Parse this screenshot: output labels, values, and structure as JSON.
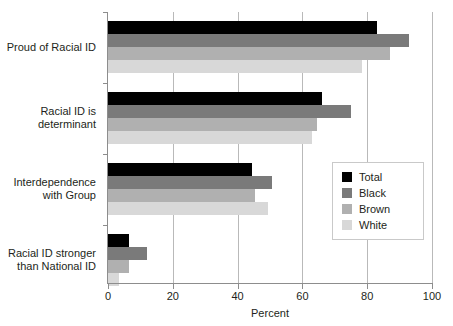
{
  "chart_data": {
    "type": "bar",
    "orientation": "horizontal",
    "title": "",
    "xlabel": "Percent",
    "ylabel": "",
    "xlim": [
      0,
      100
    ],
    "xticks": [
      0,
      20,
      40,
      60,
      80,
      100
    ],
    "xtick_labels": [
      "0",
      "20",
      "40",
      "60",
      "80",
      "100"
    ],
    "grid": "vertical",
    "legend_position": "center-right",
    "categories": [
      "Proud of Racial ID",
      "Racial ID is determinant",
      "Interdependence with Group",
      "Racial ID stronger than National ID"
    ],
    "category_label_lines": [
      [
        "Proud of Racial ID"
      ],
      [
        "Racial ID is",
        "determinant"
      ],
      [
        "Interdependence",
        "with Group"
      ],
      [
        "Racial ID stronger",
        "than National ID"
      ]
    ],
    "series": [
      {
        "name": "Total",
        "color": "#000000",
        "values": [
          83,
          66,
          44.5,
          6.5
        ]
      },
      {
        "name": "Black",
        "color": "#7a7a7a",
        "values": [
          93,
          75,
          50.5,
          12
        ]
      },
      {
        "name": "Brown",
        "color": "#b0b0b0",
        "values": [
          87,
          64.5,
          45.5,
          6.5
        ]
      },
      {
        "name": "White",
        "color": "#d8d8d8",
        "values": [
          78.5,
          63,
          49.5,
          3.5
        ]
      }
    ]
  },
  "legend": {
    "items": [
      {
        "label": "Total",
        "color": "#000000"
      },
      {
        "label": "Black",
        "color": "#7a7a7a"
      },
      {
        "label": "Brown",
        "color": "#b0b0b0"
      },
      {
        "label": "White",
        "color": "#d8d8d8"
      }
    ]
  },
  "axis": {
    "x_title": "Percent"
  }
}
